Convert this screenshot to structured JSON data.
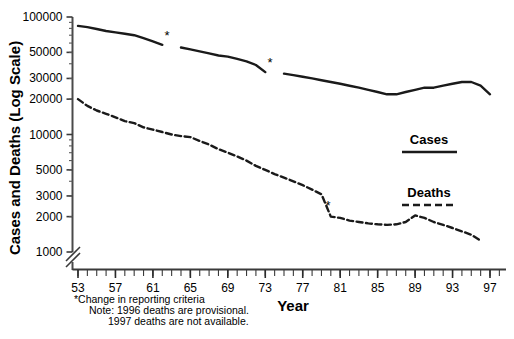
{
  "chart_data": {
    "type": "line",
    "title": "",
    "xlabel": "Year",
    "ylabel": "Cases and Deaths (Log Scale)",
    "yscale": "log",
    "ylim": [
      1000,
      100000
    ],
    "y_axis_break": true,
    "y_break_note": "axis broken between baseline and 1000",
    "ytick_labels": [
      "100000",
      "50000",
      "30000",
      "20000",
      "10000",
      "5000",
      "3000",
      "2000",
      "1000"
    ],
    "ytick_values": [
      100000,
      50000,
      30000,
      20000,
      10000,
      5000,
      3000,
      2000,
      1000
    ],
    "xlim": [
      53,
      98
    ],
    "xtick_labels": [
      "53",
      "57",
      "61",
      "65",
      "69",
      "73",
      "77",
      "81",
      "85",
      "89",
      "93",
      "97"
    ],
    "xtick_values": [
      53,
      57,
      61,
      65,
      69,
      73,
      77,
      81,
      85,
      89,
      93,
      97
    ],
    "x_minor_ticks_every": 1,
    "grid": false,
    "legend_position": "right-middle",
    "series": [
      {
        "name": "Cases",
        "style": "solid",
        "color": "#1a1a1a",
        "x": [
          53,
          54,
          55,
          56,
          57,
          58,
          59,
          60,
          61,
          62,
          63,
          64,
          65,
          66,
          67,
          68,
          69,
          70,
          71,
          72,
          73,
          74,
          75,
          76,
          77,
          78,
          79,
          80,
          81,
          82,
          83,
          84,
          85,
          86,
          87,
          88,
          89,
          90,
          91,
          92,
          93,
          94,
          95,
          96,
          97
        ],
        "values": [
          84000,
          82000,
          79000,
          76000,
          74000,
          72000,
          70000,
          66000,
          62000,
          58000,
          57000,
          55000,
          53000,
          51000,
          49000,
          47000,
          46000,
          44000,
          42000,
          39000,
          34000,
          33000,
          33000,
          32000,
          31000,
          30000,
          29000,
          28000,
          27000,
          26000,
          25000,
          24000,
          23000,
          22000,
          22000,
          23000,
          24000,
          25000,
          25000,
          26000,
          27000,
          28000,
          28000,
          26000,
          22000
        ],
        "breaks_at": [
          62.5,
          73.5
        ]
      },
      {
        "name": "Deaths",
        "style": "dashed",
        "color": "#1a1a1a",
        "x": [
          53,
          54,
          55,
          56,
          57,
          58,
          59,
          60,
          61,
          62,
          63,
          64,
          65,
          66,
          67,
          68,
          69,
          70,
          71,
          72,
          73,
          74,
          75,
          76,
          77,
          78,
          79,
          80,
          81,
          82,
          83,
          84,
          85,
          86,
          87,
          88,
          89,
          90,
          91,
          92,
          93,
          94,
          95,
          96
        ],
        "values": [
          20000,
          17500,
          16000,
          15000,
          14000,
          13000,
          12500,
          11500,
          11000,
          10500,
          10000,
          9700,
          9500,
          8800,
          8200,
          7500,
          7000,
          6500,
          6000,
          5400,
          5000,
          4600,
          4300,
          4000,
          3700,
          3400,
          3100,
          2000,
          1950,
          1850,
          1800,
          1750,
          1720,
          1700,
          1720,
          1800,
          2050,
          1950,
          1800,
          1700,
          1600,
          1500,
          1400,
          1250
        ],
        "breaks_at": []
      }
    ],
    "annotations": [
      {
        "label": "*",
        "series": "Cases",
        "x": 62.5,
        "y": 58000
      },
      {
        "label": "*",
        "series": "Cases",
        "x": 73.5,
        "y": 34000
      },
      {
        "label": "*",
        "series": "Deaths",
        "x": 79.7,
        "y": 2050
      }
    ],
    "footnotes": [
      "*Change in reporting criteria",
      "Note: 1996 deaths are provisional.",
      "1997 deaths are not available."
    ]
  },
  "axes": {
    "y_title": "Cases and Deaths (Log Scale)",
    "x_title": "Year"
  },
  "legend": {
    "cases_label": "Cases",
    "deaths_label": "Deaths"
  },
  "notes": {
    "line1": "*Change in reporting criteria",
    "line2": "Note: 1996 deaths are provisional.",
    "line3": "1997 deaths are not available."
  }
}
